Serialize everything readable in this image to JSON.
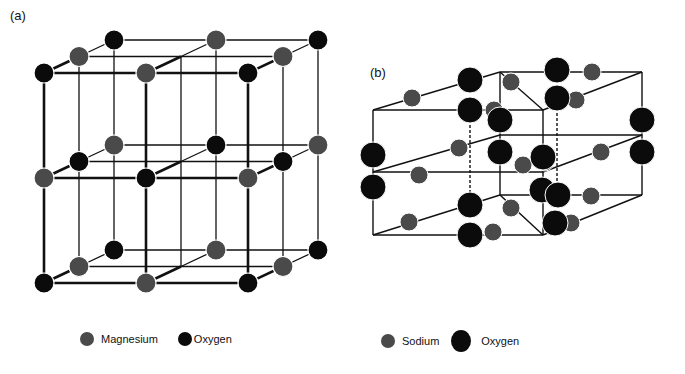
{
  "panels": {
    "a": {
      "label": "(a)",
      "title": "Magnesium oxide lattice",
      "legend": [
        {
          "name": "Magnesium",
          "color": "#4a4a4a"
        },
        {
          "name": "Oxygen",
          "color": "#0b0b0b"
        }
      ]
    },
    "b": {
      "label": "(b)",
      "title": "Sodium peroxide lattice",
      "legend": [
        {
          "name": "Sodium",
          "color": "#4a4a4a"
        },
        {
          "name": "Oxygen",
          "color": "#0b0b0b"
        }
      ]
    }
  },
  "colors": {
    "mg": "#4a4a4a",
    "na": "#4a4a4a",
    "oxygen": "#0b0b0b",
    "line": "#111111"
  }
}
